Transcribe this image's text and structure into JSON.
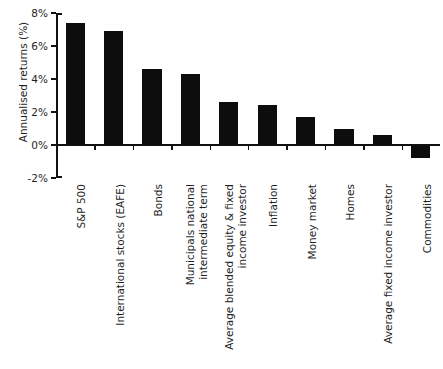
{
  "title": "",
  "axes": {
    "ylabel": "Annualised returns (%)",
    "xlabel": "",
    "yticks": [
      "8%",
      "6%",
      "4%",
      "2%",
      "0%",
      "-2%"
    ]
  },
  "chart_data": {
    "type": "bar",
    "title": "",
    "xlabel": "",
    "ylabel": "Annualised returns (%)",
    "ylim": [
      -2,
      8
    ],
    "ytick_values": [
      8,
      6,
      4,
      2,
      0,
      -2
    ],
    "ytick_labels": [
      "8%",
      "6%",
      "4%",
      "2%",
      "0%",
      "-2%"
    ],
    "grid": false,
    "legend": "none",
    "bar_color": "#0d0d0d",
    "categories": [
      "S&P 500",
      "International stocks (EAFE)",
      "Bonds",
      "Municipals national intermediate term",
      "Average blended equity & fixed income investor",
      "Inflation",
      "Money market",
      "Homes",
      "Average fixed income investor",
      "Commodities"
    ],
    "category_lines": [
      [
        "S&P 500"
      ],
      [
        "International stocks (EAFE)"
      ],
      [
        "Bonds"
      ],
      [
        "Municipals national",
        "intermediate term"
      ],
      [
        "Average blended equity & fixed",
        "income investor"
      ],
      [
        "Inflation"
      ],
      [
        "Money market"
      ],
      [
        "Homes"
      ],
      [
        "Average fixed income investor"
      ],
      [
        "Commodities"
      ]
    ],
    "values": [
      7.4,
      6.9,
      4.6,
      4.3,
      2.6,
      2.4,
      1.7,
      1.0,
      0.6,
      -0.8
    ]
  }
}
